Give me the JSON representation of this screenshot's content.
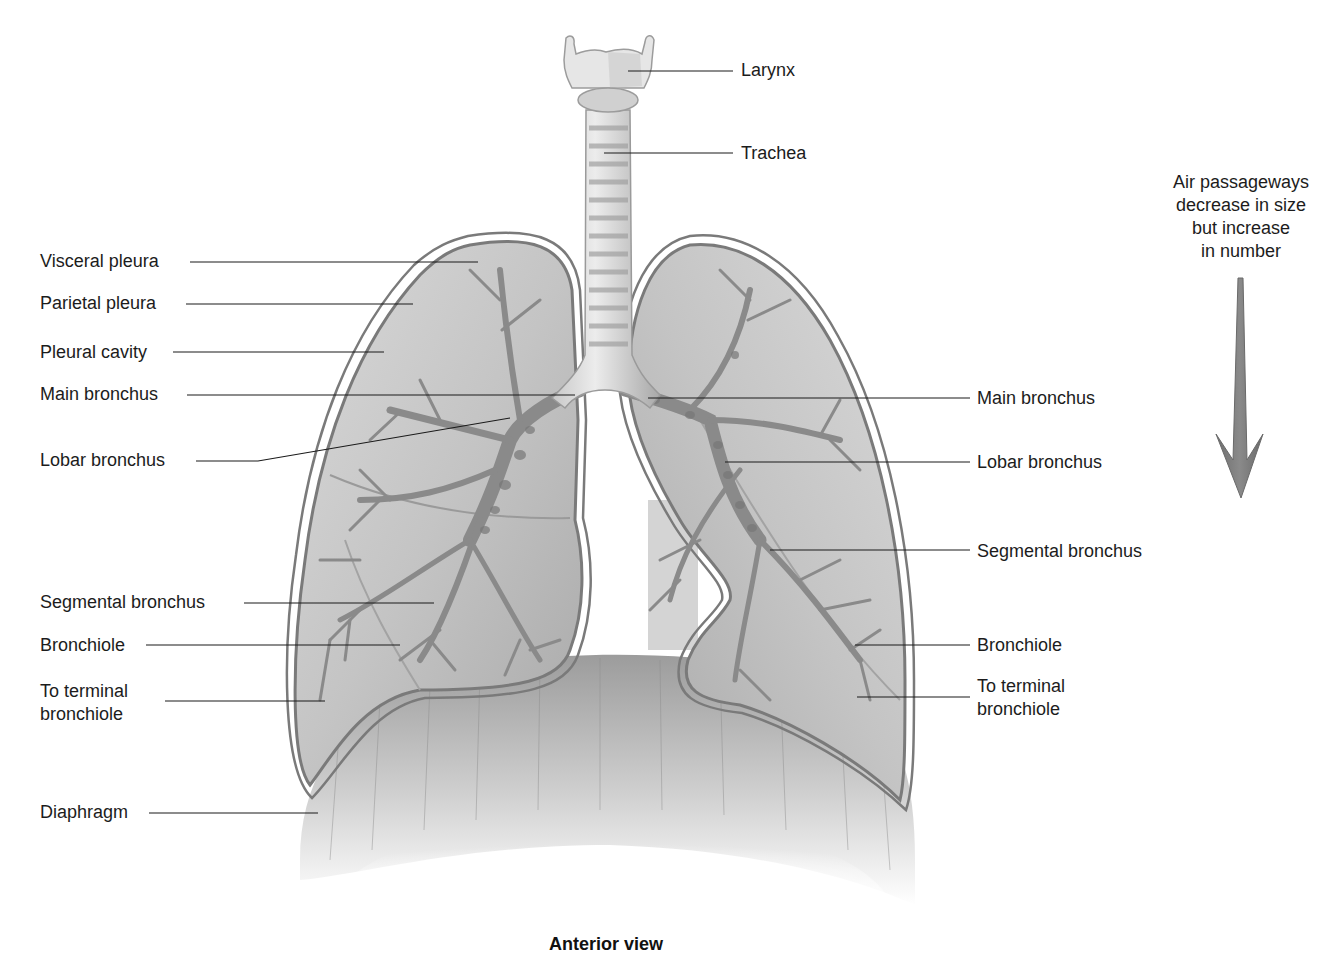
{
  "figure": {
    "caption": "Anterior view",
    "note": {
      "lines": [
        "Air passageways",
        "decrease in size",
        "but increase",
        "in number"
      ],
      "arrow": "down-arrow"
    },
    "colors": {
      "background": "#ffffff",
      "lung_fill": "#bdbdbd",
      "pleura_outline": "#7a7a7a",
      "bronchi": "#8f8f8f",
      "leader_line": "#1a1a1a",
      "arrow": "#7b7b7b"
    }
  },
  "labels": {
    "top": [
      {
        "id": "larynx",
        "text": "Larynx"
      },
      {
        "id": "trachea",
        "text": "Trachea"
      }
    ],
    "left": [
      {
        "id": "visceral-pleura",
        "text": "Visceral pleura"
      },
      {
        "id": "parietal-pleura",
        "text": "Parietal pleura"
      },
      {
        "id": "pleural-cavity",
        "text": "Pleural cavity"
      },
      {
        "id": "main-bronchus",
        "text": "Main bronchus"
      },
      {
        "id": "lobar-bronchus",
        "text": "Lobar bronchus"
      },
      {
        "id": "segmental-bronchus",
        "text": "Segmental bronchus"
      },
      {
        "id": "bronchiole",
        "text": "Bronchiole"
      },
      {
        "id": "to-terminal-bronchiole",
        "text": "To terminal bronchiole",
        "line1": "To terminal",
        "line2": "bronchiole"
      },
      {
        "id": "diaphragm",
        "text": "Diaphragm"
      }
    ],
    "right": [
      {
        "id": "main-bronchus",
        "text": "Main bronchus"
      },
      {
        "id": "lobar-bronchus",
        "text": "Lobar bronchus"
      },
      {
        "id": "segmental-bronchus",
        "text": "Segmental bronchus"
      },
      {
        "id": "bronchiole",
        "text": "Bronchiole"
      },
      {
        "id": "to-terminal-bronchiole",
        "text": "To terminal bronchiole",
        "line1": "To terminal",
        "line2": "bronchiole"
      }
    ]
  }
}
